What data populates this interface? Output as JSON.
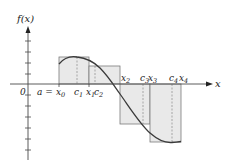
{
  "diagram": {
    "y_axis_label": "f(x)",
    "x_axis_label": "x",
    "origin_label": "0",
    "a_label": "a =",
    "colors": {
      "rect_fill": "#e9e9e9",
      "rect_stroke": "#7a7a7a",
      "curve": "#3a3a3a",
      "axis": "#4a4a4a",
      "dashed": "#8a8a8a"
    },
    "points": [
      {
        "name": "x",
        "sub": "0",
        "x": 59
      },
      {
        "name": "c",
        "sub": "1",
        "x": 77
      },
      {
        "name": "x",
        "sub": "1",
        "x": 89
      },
      {
        "name": "c",
        "sub": "2",
        "x": 95
      },
      {
        "name": "x",
        "sub": "2",
        "x": 120
      },
      {
        "name": "c",
        "sub": "3",
        "x": 143
      },
      {
        "name": "x",
        "sub": "3",
        "x": 150
      },
      {
        "name": "c",
        "sub": "4",
        "x": 172
      },
      {
        "name": "x",
        "sub": "4",
        "x": 181
      }
    ],
    "labels": {
      "x0": "x",
      "x0_sub": "0",
      "c1": "c",
      "c1_sub": "1",
      "x1": "x",
      "x1_sub": "1",
      "c2": "c",
      "c2_sub": "2",
      "x2": "x",
      "x2_sub": "2",
      "c3": "c",
      "c3_sub": "3",
      "x3": "x",
      "x3_sub": "3",
      "c4": "c",
      "c4_sub": "4",
      "x4": "x",
      "x4_sub": "4"
    },
    "rectangles": [
      {
        "from": "x0",
        "to": "x1",
        "height_at": "c1",
        "sign": "positive"
      },
      {
        "from": "x1",
        "to": "x2",
        "height_at": "c2",
        "sign": "positive"
      },
      {
        "from": "x2",
        "to": "x3",
        "height_at": "c3",
        "sign": "negative"
      },
      {
        "from": "x3",
        "to": "x4",
        "height_at": "c4",
        "sign": "negative"
      }
    ]
  }
}
